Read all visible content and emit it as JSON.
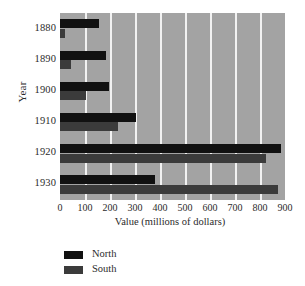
{
  "chart_data": {
    "type": "bar",
    "orientation": "horizontal",
    "title": "",
    "xlabel": "Value (millions of dollars)",
    "ylabel": "Year",
    "categories": [
      "1880",
      "1890",
      "1900",
      "1910",
      "1920",
      "1930"
    ],
    "xlim": [
      0,
      900
    ],
    "xticks": [
      0,
      100,
      200,
      300,
      400,
      500,
      600,
      700,
      800,
      900
    ],
    "xtick_labels": [
      "0",
      "100",
      "200",
      "300",
      "400",
      "500",
      "600",
      "700",
      "800",
      "900"
    ],
    "grid": "vertical-white-gridlines",
    "plot_background": "#a3a3a3",
    "legend_position": "below-axis-left",
    "series": [
      {
        "name": "North",
        "color": "#111111",
        "values": [
          155,
          185,
          195,
          305,
          885,
          380
        ]
      },
      {
        "name": "South",
        "color": "#3b3b3b",
        "values": [
          20,
          45,
          105,
          230,
          825,
          870
        ]
      }
    ]
  },
  "legend": {
    "items": [
      {
        "label": "North",
        "swatch": "north"
      },
      {
        "label": "South",
        "swatch": "south"
      }
    ]
  },
  "axes": {
    "y_title": "Year",
    "x_title": "Value (millions of dollars)"
  }
}
